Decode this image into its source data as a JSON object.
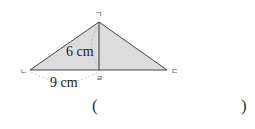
{
  "figure": {
    "vertices": {
      "top": "ㄱ",
      "left": "ㄴ",
      "right": "ㄷ",
      "foot": "ㄹ"
    },
    "height_label": "6 cm",
    "base_part_label": "9 cm",
    "fill_color": "#d9d9d9",
    "stroke_color": "#444444"
  },
  "answer": {
    "open": "(",
    "close": ")"
  }
}
